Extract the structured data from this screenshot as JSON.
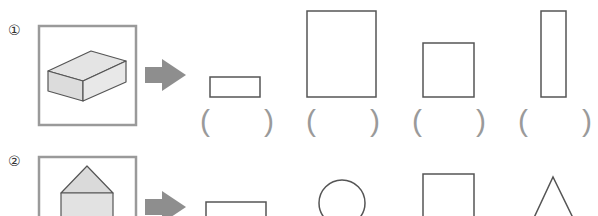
{
  "problems": [
    {
      "number": "①",
      "solid": "rectangular-prism",
      "options": [
        "rectangle-wide",
        "rectangle-tall-large",
        "square",
        "rectangle-thin-tall"
      ],
      "answer_brackets": [
        {
          "open": "(",
          "close": ")"
        },
        {
          "open": "(",
          "close": ")"
        },
        {
          "open": "(",
          "close": ")"
        },
        {
          "open": "(",
          "close": ")"
        }
      ]
    },
    {
      "number": "②",
      "solid": "pentagonal-prism-house",
      "options": [
        "rectangle",
        "circle",
        "rectangle-tall",
        "triangle"
      ]
    }
  ],
  "colors": {
    "frame": "#9a9a9a",
    "arrow": "#8c8c8c",
    "solid_fill": "#e2e2e2",
    "outline": "#555555"
  }
}
